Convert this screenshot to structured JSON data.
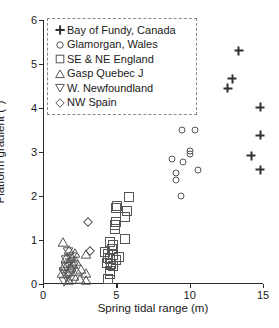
{
  "chart_data": {
    "type": "scatter",
    "title": "",
    "xlabel": "Spring tidal range (m)",
    "ylabel": "Platform gradient (°)",
    "xlim": [
      0,
      15
    ],
    "ylim": [
      0,
      6
    ],
    "xticks": [
      0,
      5,
      10,
      15
    ],
    "yticks": [
      0,
      1,
      2,
      3,
      4,
      5,
      6
    ],
    "grid": false,
    "legend_position": "upper-left",
    "series": [
      {
        "name": "Bay of Fundy, Canada",
        "marker": "plus",
        "points": [
          [
            13.35,
            5.3
          ],
          [
            12.9,
            4.67
          ],
          [
            12.6,
            4.45
          ],
          [
            14.8,
            4.02
          ],
          [
            14.8,
            3.38
          ],
          [
            14.2,
            2.92
          ],
          [
            14.8,
            2.6
          ]
        ]
      },
      {
        "name": "Glamorgan, Wales",
        "marker": "circle",
        "points": [
          [
            9.45,
            3.5
          ],
          [
            10.35,
            3.5
          ],
          [
            10.05,
            3.03
          ],
          [
            10.05,
            2.95
          ],
          [
            8.8,
            2.85
          ],
          [
            9.55,
            2.78
          ],
          [
            10.6,
            2.6
          ],
          [
            9.05,
            2.52
          ],
          [
            9.05,
            2.37
          ],
          [
            9.4,
            2.0
          ]
        ]
      },
      {
        "name": "SE & NE England",
        "marker": "square",
        "points": [
          [
            5.85,
            1.98
          ],
          [
            5.05,
            1.78
          ],
          [
            5.0,
            1.72
          ],
          [
            5.7,
            1.66
          ],
          [
            5.6,
            1.52
          ],
          [
            4.95,
            1.4
          ],
          [
            4.9,
            1.33
          ],
          [
            4.9,
            1.26
          ],
          [
            5.6,
            1.02
          ],
          [
            4.55,
            0.95
          ],
          [
            4.75,
            0.88
          ],
          [
            4.7,
            0.8
          ],
          [
            4.2,
            0.72
          ],
          [
            4.45,
            0.68
          ],
          [
            4.8,
            0.66
          ],
          [
            5.2,
            0.62
          ],
          [
            4.4,
            0.58
          ],
          [
            4.6,
            0.56
          ],
          [
            4.95,
            0.55
          ],
          [
            4.35,
            0.48
          ],
          [
            4.65,
            0.45
          ],
          [
            4.8,
            0.4
          ],
          [
            4.55,
            0.3
          ],
          [
            4.6,
            0.22
          ],
          [
            4.4,
            0.12
          ]
        ]
      },
      {
        "name": "Gasp Quebec J",
        "marker": "triangle-up",
        "points": [
          [
            1.35,
            0.95
          ],
          [
            1.8,
            0.78
          ],
          [
            2.15,
            0.7
          ],
          [
            2.9,
            0.68
          ],
          [
            1.6,
            0.6
          ],
          [
            1.95,
            0.58
          ],
          [
            2.25,
            0.52
          ],
          [
            1.7,
            0.48
          ],
          [
            2.05,
            0.45
          ],
          [
            1.45,
            0.42
          ],
          [
            1.9,
            0.38
          ],
          [
            2.6,
            0.35
          ],
          [
            2.35,
            0.3
          ],
          [
            1.3,
            0.25
          ],
          [
            2.9,
            0.25
          ],
          [
            2.1,
            0.18
          ],
          [
            2.55,
            0.12
          ],
          [
            1.75,
            0.1
          ],
          [
            2.95,
            0.08
          ]
        ]
      },
      {
        "name": "W. Newfoundland",
        "marker": "triangle-down",
        "points": [
          [
            1.7,
            0.72
          ],
          [
            1.95,
            0.62
          ],
          [
            1.55,
            0.55
          ],
          [
            1.85,
            0.48
          ],
          [
            2.1,
            0.44
          ],
          [
            1.6,
            0.38
          ],
          [
            1.9,
            0.32
          ],
          [
            1.4,
            0.28
          ],
          [
            1.75,
            0.22
          ],
          [
            1.55,
            0.15
          ],
          [
            1.85,
            0.08
          ],
          [
            1.45,
            0.05
          ]
        ]
      },
      {
        "name": "NW Spain",
        "marker": "diamond",
        "points": [
          [
            3.1,
            1.4
          ],
          [
            3.2,
            0.75
          ]
        ]
      }
    ]
  },
  "axes": {
    "x": {
      "title": "Spring tidal range (m)",
      "ticks": [
        "0",
        "5",
        "10",
        "15"
      ]
    },
    "y": {
      "title": "Platform gradient (°)",
      "ticks": [
        "0",
        "1",
        "2",
        "3",
        "4",
        "5",
        "6"
      ]
    }
  },
  "legend": {
    "items": [
      {
        "symbol": "plus",
        "label": "Bay of Fundy, Canada"
      },
      {
        "symbol": "circle",
        "label": "Glamorgan, Wales"
      },
      {
        "symbol": "square",
        "label": "SE & NE England"
      },
      {
        "symbol": "triangle-up",
        "label": "Gasp Quebec J"
      },
      {
        "symbol": "triangle-down",
        "label": "W. Newfoundland"
      },
      {
        "symbol": "diamond",
        "label": "NW Spain"
      }
    ]
  },
  "style": {
    "marker_stroke": "#555555",
    "plus_color": "#303030",
    "axis_color": "#2b2b2b",
    "text_color": "#1a1a1a",
    "legend_border": "#8a8a8a",
    "background": "#ffffff"
  }
}
